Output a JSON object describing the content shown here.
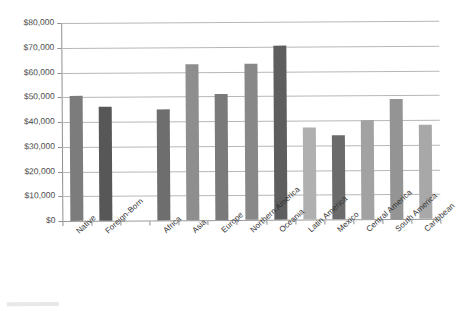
{
  "chart_data": {
    "type": "bar",
    "title": "",
    "subtitle": "",
    "xlabel": "",
    "ylabel": "",
    "ylim": [
      0,
      80000
    ],
    "ytick_step": 10000,
    "ytick_labels": [
      "$0",
      "$10,000",
      "$20,000",
      "$30,000",
      "$40,000",
      "$50,000",
      "$60,000",
      "$70,000",
      "$80,000"
    ],
    "ytick_values": [
      0,
      10000,
      20000,
      30000,
      40000,
      50000,
      60000,
      70000,
      80000
    ],
    "grid": "horizontal",
    "legend": "none",
    "categories": [
      "Native",
      "Foreign-Born",
      "",
      "Africa",
      "Asia",
      "Europe",
      "Northern America",
      "Oceania",
      "Latin America",
      "Mexico",
      "Central America",
      "South America",
      "Caribbean"
    ],
    "values": [
      50500,
      46000,
      null,
      45000,
      63000,
      51000,
      63000,
      70500,
      37000,
      34000,
      40000,
      48500,
      38000
    ],
    "bar_colors": [
      "#7c7c7c",
      "#575757",
      "",
      "#6e6e6e",
      "#8e8e8e",
      "#7a7a7a",
      "#888888",
      "#5e5e5e",
      "#b0b0b0",
      "#6b6b6b",
      "#a2a2a2",
      "#949494",
      "#a8a8a8"
    ],
    "annotations": []
  },
  "axis": {
    "axis_line_color": "#8f8f8f",
    "gridline_color": "#b7b7b7"
  }
}
